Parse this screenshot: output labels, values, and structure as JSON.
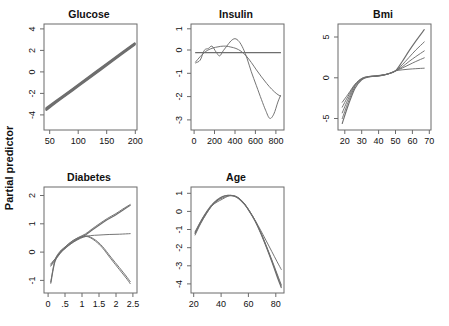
{
  "figure": {
    "ylabel": "Partial predictor",
    "background": "#ffffff",
    "curve_color": "#6e6e6e",
    "axis_color": "#6b6b6b",
    "layout": "2 rows: 3 panels top (Glucose, Insulin, Bmi), 2 panels bottom (Diabetes, Age)"
  },
  "chart_data": [
    {
      "type": "line",
      "title": "Glucose",
      "xlabel": "",
      "ylabel": "Partial predictor",
      "xlim": [
        40,
        203
      ],
      "ylim": [
        -4.6,
        4.4
      ],
      "xticks": [
        50,
        100,
        150,
        200
      ],
      "yticks": [
        4,
        2,
        0,
        -2,
        -4
      ],
      "xtick_labels": [
        "50",
        "100",
        "150",
        "200"
      ],
      "ytick_labels": [
        "4",
        "2",
        "0",
        "-2",
        "-4"
      ],
      "grid": false,
      "legend": "none",
      "series": [
        {
          "name": "linear fit (overplotted bundle)",
          "x": [
            44,
            70,
            100,
            130,
            160,
            199
          ],
          "y": [
            -2.82,
            -1.88,
            -0.82,
            0.25,
            1.32,
            2.71
          ]
        },
        {
          "name": "overlay 2",
          "x": [
            44,
            70,
            100,
            130,
            160,
            199
          ],
          "y": [
            -2.74,
            -1.82,
            -0.76,
            0.31,
            1.38,
            2.76
          ]
        },
        {
          "name": "overlay 3",
          "x": [
            44,
            70,
            100,
            130,
            160,
            199
          ],
          "y": [
            -2.9,
            -1.95,
            -0.89,
            0.18,
            1.26,
            2.65
          ]
        }
      ]
    },
    {
      "type": "line",
      "title": "Insulin",
      "xlabel": "",
      "ylabel": "",
      "xlim": [
        -30,
        880
      ],
      "ylim": [
        -3.3,
        1.25
      ],
      "xticks": [
        0,
        200,
        400,
        600,
        800
      ],
      "yticks": [
        1,
        0,
        -1,
        -2,
        -3
      ],
      "xtick_labels": [
        "0",
        "200",
        "400",
        "600",
        "800"
      ],
      "ytick_labels": [
        "1",
        "0",
        "-1",
        "-2",
        "-3"
      ],
      "grid": false,
      "legend": "none",
      "series": [
        {
          "name": "flat zero line",
          "x": [
            15,
            200,
            400,
            600,
            846
          ],
          "y": [
            0.02,
            0.02,
            0.02,
            0.02,
            0.02
          ]
        },
        {
          "name": "wiggly spline",
          "x": [
            15,
            60,
            100,
            140,
            175,
            215,
            250,
            285,
            320,
            360,
            400,
            440,
            480,
            520,
            560,
            610,
            660,
            700,
            740,
            780,
            820,
            846
          ],
          "y": [
            -0.42,
            -0.3,
            0.12,
            0.2,
            0.3,
            0.05,
            -0.12,
            0.1,
            0.3,
            0.52,
            0.62,
            0.5,
            0.2,
            -0.25,
            -0.8,
            -1.4,
            -2.0,
            -2.45,
            -2.8,
            -2.62,
            -2.1,
            -1.82
          ]
        },
        {
          "name": "smooth curve",
          "x": [
            15,
            60,
            110,
            160,
            210,
            260,
            310,
            360,
            410,
            460,
            510,
            560,
            610,
            660,
            710,
            760,
            810,
            846
          ],
          "y": [
            -0.38,
            -0.15,
            0.06,
            0.18,
            0.25,
            0.29,
            0.3,
            0.26,
            0.2,
            0.08,
            -0.12,
            -0.4,
            -0.72,
            -1.02,
            -1.3,
            -1.55,
            -1.75,
            -1.85
          ]
        }
      ]
    },
    {
      "type": "line",
      "title": "Bmi",
      "xlabel": "",
      "ylabel": "",
      "xlim": [
        16,
        71
      ],
      "ylim": [
        -6.4,
        6.6
      ],
      "xticks": [
        20,
        30,
        40,
        50,
        60,
        70
      ],
      "yticks": [
        5,
        0,
        -5
      ],
      "xtick_labels": [
        "20",
        "30",
        "40",
        "50",
        "60",
        "70"
      ],
      "ytick_labels": [
        "5",
        "0",
        "-5"
      ],
      "grid": false,
      "legend": "none",
      "series": [
        {
          "name": "fan curve 1 (steepest)",
          "x": [
            18.5,
            22,
            26,
            30,
            34,
            38,
            42,
            46,
            50,
            54,
            58,
            62,
            67
          ],
          "y": [
            -5.6,
            -3.4,
            -1.3,
            -0.25,
            0.1,
            0.18,
            0.3,
            0.5,
            0.85,
            2.0,
            3.3,
            4.5,
            5.9
          ]
        },
        {
          "name": "fan curve 2",
          "x": [
            18.5,
            22,
            26,
            30,
            34,
            38,
            42,
            46,
            50,
            54,
            58,
            62,
            67
          ],
          "y": [
            -5.0,
            -3.0,
            -1.1,
            -0.2,
            0.12,
            0.2,
            0.3,
            0.5,
            0.85,
            1.6,
            2.5,
            3.4,
            4.4
          ]
        },
        {
          "name": "fan curve 3",
          "x": [
            18.5,
            22,
            26,
            30,
            34,
            38,
            42,
            46,
            50,
            54,
            58,
            62,
            67
          ],
          "y": [
            -4.3,
            -2.6,
            -0.95,
            -0.15,
            0.13,
            0.2,
            0.3,
            0.5,
            0.85,
            1.35,
            2.0,
            2.6,
            3.3
          ]
        },
        {
          "name": "fan curve 4",
          "x": [
            18.5,
            22,
            26,
            30,
            34,
            38,
            42,
            46,
            50,
            54,
            58,
            62,
            67
          ],
          "y": [
            -3.6,
            -2.25,
            -0.85,
            -0.1,
            0.15,
            0.22,
            0.32,
            0.5,
            0.85,
            1.2,
            1.6,
            2.0,
            2.45
          ]
        },
        {
          "name": "fan curve 5 (flattest)",
          "x": [
            18.5,
            22,
            26,
            30,
            34,
            38,
            42,
            46,
            50,
            54,
            58,
            62,
            67
          ],
          "y": [
            -3.0,
            -2.0,
            -0.8,
            -0.08,
            0.16,
            0.24,
            0.34,
            0.52,
            0.85,
            0.98,
            1.06,
            1.12,
            1.18
          ]
        }
      ]
    },
    {
      "type": "line",
      "title": "Diabetes",
      "xlabel": "",
      "ylabel": "Partial predictor",
      "xlim": [
        -0.12,
        2.62
      ],
      "ylim": [
        -1.45,
        2.3
      ],
      "xticks": [
        0,
        0.5,
        1,
        1.5,
        2,
        2.5
      ],
      "yticks": [
        2,
        1,
        0,
        -1
      ],
      "xtick_labels": [
        "0",
        ".5",
        "1",
        "1.5",
        "2",
        "2.5"
      ],
      "ytick_labels": [
        "2",
        "1",
        "0",
        "-1"
      ],
      "grid": false,
      "legend": "none",
      "series": [
        {
          "name": "rising branch",
          "x": [
            0.08,
            0.2,
            0.35,
            0.5,
            0.7,
            0.9,
            1.1,
            1.3,
            1.5,
            1.75,
            2.0,
            2.2,
            2.42
          ],
          "y": [
            -1.1,
            -0.35,
            -0.02,
            0.13,
            0.33,
            0.48,
            0.6,
            0.78,
            0.95,
            1.15,
            1.32,
            1.48,
            1.65
          ]
        },
        {
          "name": "rising branch overlay",
          "x": [
            0.08,
            0.2,
            0.35,
            0.5,
            0.7,
            0.9,
            1.1,
            1.3,
            1.5,
            1.75,
            2.0,
            2.2,
            2.42
          ],
          "y": [
            -1.05,
            -0.3,
            0.02,
            0.18,
            0.38,
            0.52,
            0.64,
            0.82,
            0.99,
            1.19,
            1.36,
            1.52,
            1.68
          ]
        },
        {
          "name": "flat branch",
          "x": [
            0.08,
            0.25,
            0.45,
            0.65,
            0.85,
            1.05,
            1.25,
            1.5,
            1.8,
            2.1,
            2.42
          ],
          "y": [
            -0.42,
            -0.18,
            0.08,
            0.27,
            0.42,
            0.53,
            0.58,
            0.6,
            0.62,
            0.63,
            0.65
          ]
        },
        {
          "name": "falling branch",
          "x": [
            0.08,
            0.25,
            0.45,
            0.65,
            0.85,
            1.05,
            1.2,
            1.4,
            1.6,
            1.85,
            2.1,
            2.3,
            2.42
          ],
          "y": [
            -0.46,
            -0.18,
            0.12,
            0.33,
            0.48,
            0.56,
            0.55,
            0.42,
            0.2,
            -0.18,
            -0.55,
            -0.85,
            -1.05
          ]
        },
        {
          "name": "falling branch overlay",
          "x": [
            0.08,
            0.25,
            0.45,
            0.65,
            0.85,
            1.05,
            1.2,
            1.4,
            1.6,
            1.85,
            2.1,
            2.3,
            2.42
          ],
          "y": [
            -0.5,
            -0.22,
            0.08,
            0.29,
            0.45,
            0.54,
            0.53,
            0.38,
            0.15,
            -0.24,
            -0.62,
            -0.92,
            -1.12
          ]
        }
      ]
    },
    {
      "type": "line",
      "title": "Age",
      "xlabel": "",
      "ylabel": "",
      "xlim": [
        18,
        86
      ],
      "ylim": [
        -4.5,
        1.35
      ],
      "xticks": [
        20,
        40,
        60,
        80
      ],
      "yticks": [
        1,
        0,
        -1,
        -2,
        -3,
        -4
      ],
      "xtick_labels": [
        "20",
        "40",
        "60",
        "80"
      ],
      "ytick_labels": [
        "1",
        "0",
        "-1",
        "-2",
        "-3",
        "-4"
      ],
      "grid": false,
      "legend": "none",
      "series": [
        {
          "name": "main curve",
          "x": [
            21,
            25,
            29,
            33,
            37,
            41,
            45,
            49,
            53,
            57,
            61,
            65,
            69,
            73,
            77,
            81,
            84
          ],
          "y": [
            -1.22,
            -0.62,
            -0.12,
            0.32,
            0.63,
            0.82,
            0.88,
            0.85,
            0.7,
            0.4,
            -0.02,
            -0.55,
            -1.2,
            -1.95,
            -2.75,
            -3.6,
            -4.2
          ]
        },
        {
          "name": "curve overlay 2",
          "x": [
            21,
            25,
            29,
            33,
            37,
            41,
            45,
            49,
            53,
            57,
            61,
            65,
            69,
            73,
            77,
            81,
            84
          ],
          "y": [
            -1.12,
            -0.55,
            -0.05,
            0.36,
            0.6,
            0.74,
            0.86,
            0.88,
            0.74,
            0.44,
            0.0,
            -0.52,
            -1.15,
            -1.88,
            -2.65,
            -3.45,
            -4.05
          ]
        },
        {
          "name": "curve overlay 3 (shallower tail)",
          "x": [
            21,
            25,
            29,
            33,
            37,
            41,
            45,
            49,
            53,
            57,
            61,
            65,
            69,
            73,
            77,
            81,
            84
          ],
          "y": [
            -1.3,
            -0.68,
            -0.16,
            0.28,
            0.58,
            0.8,
            0.9,
            0.86,
            0.72,
            0.42,
            -0.04,
            -0.5,
            -1.05,
            -1.62,
            -2.2,
            -2.78,
            -3.2
          ]
        },
        {
          "name": "curve overlay 4",
          "x": [
            21,
            25,
            29,
            33,
            37,
            41,
            45,
            49,
            53,
            57,
            61,
            65,
            69,
            73,
            77,
            81,
            84
          ],
          "y": [
            -1.18,
            -0.58,
            -0.08,
            0.3,
            0.52,
            0.68,
            0.84,
            0.87,
            0.73,
            0.43,
            -0.01,
            -0.53,
            -1.18,
            -1.92,
            -2.7,
            -3.52,
            -4.12
          ]
        }
      ]
    }
  ]
}
